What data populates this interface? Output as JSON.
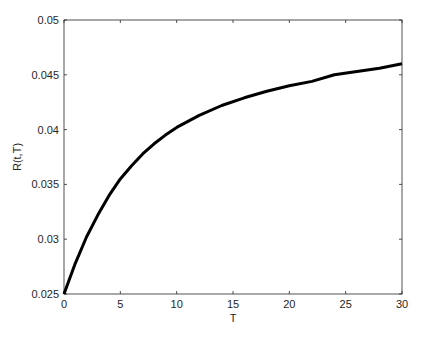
{
  "chart_data": {
    "type": "line",
    "title": "",
    "xlabel": "T",
    "ylabel": "R(t,T)",
    "xlim": [
      0,
      30
    ],
    "ylim": [
      0.025,
      0.05
    ],
    "grid": false,
    "legend": null,
    "xticks": [
      "0",
      "5",
      "10",
      "15",
      "20",
      "25",
      "30"
    ],
    "yticks": [
      "0.025",
      "0.03",
      "0.035",
      "0.04",
      "0.045",
      "0.05"
    ],
    "series": [
      {
        "name": "R(t,T)",
        "color": "#000000",
        "x": [
          0,
          1,
          2,
          3,
          4,
          5,
          6,
          7,
          8,
          9,
          10,
          12,
          14,
          16,
          18,
          20,
          22,
          24,
          26,
          28,
          30
        ],
        "y": [
          0.025,
          0.0278,
          0.0302,
          0.0322,
          0.034,
          0.0355,
          0.0367,
          0.0378,
          0.0387,
          0.0395,
          0.0402,
          0.0413,
          0.0422,
          0.0429,
          0.0435,
          0.044,
          0.0444,
          0.045,
          0.0453,
          0.0456,
          0.046
        ]
      }
    ]
  }
}
